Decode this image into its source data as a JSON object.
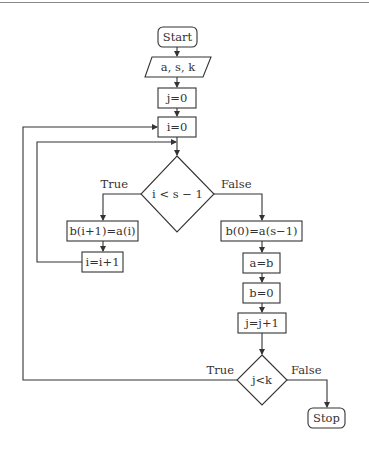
{
  "flowchart": {
    "nodes": {
      "start": {
        "label": "Start",
        "shape": "rounded-rect"
      },
      "input": {
        "label": "a, s, k",
        "shape": "parallelogram"
      },
      "init_j": {
        "label": "j=0",
        "shape": "rect"
      },
      "init_i": {
        "label": "i=0",
        "shape": "rect"
      },
      "cond_i": {
        "label": "i < s − 1",
        "shape": "diamond"
      },
      "shift": {
        "label": "b(i+1)=a(i)",
        "shape": "rect"
      },
      "inc_i": {
        "label": "i=i+1",
        "shape": "rect"
      },
      "wrap": {
        "label": "b(0)=a(s−1)",
        "shape": "rect"
      },
      "assign_a": {
        "label": "a=b",
        "shape": "rect"
      },
      "reset_b": {
        "label": "b=0",
        "shape": "rect"
      },
      "inc_j": {
        "label": "j=j+1",
        "shape": "rect"
      },
      "cond_j": {
        "label": "j<k",
        "shape": "diamond"
      },
      "stop": {
        "label": "Stop",
        "shape": "rounded-rect"
      }
    },
    "edge_labels": {
      "cond_i_true": "True",
      "cond_i_false": "False",
      "cond_j_true": "True",
      "cond_j_false": "False"
    },
    "colors": {
      "stroke": "#333333",
      "text": "#333333",
      "background": "#ffffff",
      "rule": "#8a8a8a"
    }
  }
}
